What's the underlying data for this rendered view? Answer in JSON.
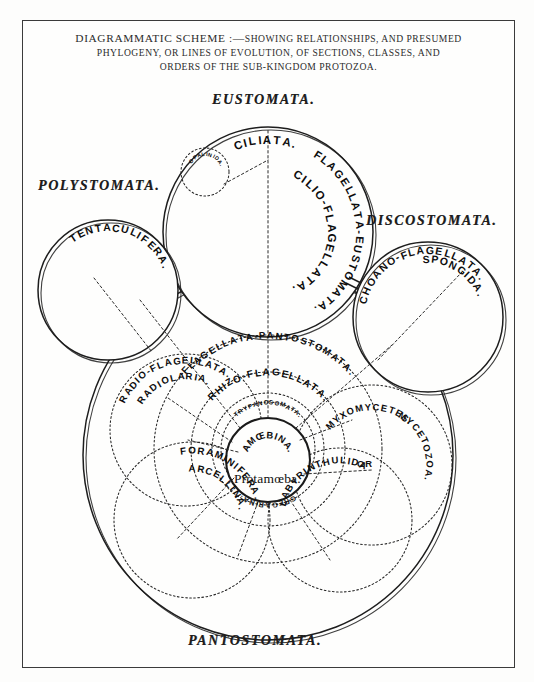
{
  "title": {
    "line1_lead": "DIAGRAMMATIC SCHEME :—",
    "line1_rest": "SHOWING RELATIONSHIPS, AND PRESUMED",
    "line2": "PHYLOGENY, OR LINES OF EVOLUTION, OF SECTIONS, CLASSES, AND",
    "line3": "ORDERS OF THE SUB-KINGDOM PROTOZOA."
  },
  "sections": {
    "eustomata": "EUSTOMATA.",
    "polystomata": "POLYSTOMATA.",
    "discostomata": "DISCOSTOMATA.",
    "pantostomata": "PANTOSTOMATA."
  },
  "groups": {
    "ciliata": "CILIATA.",
    "opalinida": "OPALINIDA.",
    "cilio_flagellata": "CILIO-FLAGELLATA.",
    "flagellata_eustomata": "FLAGELLATA-EUSTOMATA.",
    "tentaculifera": "TENTACULIFERA.",
    "spongida": "SPONGIDA.",
    "choano_flagellata": "CHOANO-FLAGELLATA.",
    "flagellata_pantostomata": "FLAGELLATA-PANTOSTOMATA.",
    "rhizo_flagellata": "RHIZO-FLAGELLATA.",
    "trypanosomata": "TRYPANOSOMATA.",
    "radiolaria": "RADIOLARIA.",
    "radio_flagellata": "RADIO-FLAGELLATA.",
    "myxomycetes": "MYXOMYCETES.",
    "or": "OR",
    "mycetozoa": "MYCETOZOA.",
    "amoebina": "AMŒBINA.",
    "protamoeba": "Protamœba.",
    "gregarina": "GREGARINA.",
    "arcellina": "ARCELLINA.",
    "foraminifera": "FORAMINIFERA.",
    "labyrinthulida": "LABYRINTHULIDA"
  },
  "colors": {
    "ink": "#1d1d1d",
    "paper": "#fdfdfc",
    "rule": "#3b3b3b"
  },
  "arcs": {
    "ciliata": {
      "cx": 268,
      "cy": 232,
      "r": 92,
      "start": -118,
      "sweep": 52,
      "size": 11.5,
      "text": "CILIATA."
    },
    "cilio_flagellata": {
      "cx": 268,
      "cy": 232,
      "r": 64,
      "start": -56,
      "sweep": 112,
      "size": 11.5,
      "text": "CILIO-FLAGELLATA."
    },
    "flagellata_eustomata": {
      "cx": 268,
      "cy": 232,
      "r": 92,
      "start": -60,
      "sweep": 120,
      "size": 11,
      "text": "FLAGELLATA-EUSTOMATA."
    },
    "opalinida": {
      "cx": 205,
      "cy": 172,
      "r": 18,
      "start": -118,
      "sweep": 68,
      "size": 5.4,
      "text": "OPALINIDA."
    },
    "tentaculifera": {
      "cx": 108,
      "cy": 290,
      "r": 63,
      "start": -112,
      "sweep": 76,
      "size": 10.5,
      "text": "TENTACULIFERA."
    },
    "spongida": {
      "cx": 428,
      "cy": 317,
      "r": 58,
      "start": -82,
      "sweep": 46,
      "size": 10.5,
      "text": "SPONGIDA."
    },
    "choano_flagellata": {
      "cx": 428,
      "cy": 317,
      "r": 67,
      "start": -158,
      "sweep": 112,
      "size": 10.5,
      "text": "CHOANO-FLAGELLATA."
    },
    "flagellata_pantostomata": {
      "cx": 268,
      "cy": 449,
      "r": 114,
      "start": -125,
      "sweep": 70,
      "size": 9.6,
      "text": "FLAGELLATA-PANTOSTOMATA."
    },
    "rhizo_flagellata": {
      "cx": 268,
      "cy": 449,
      "r": 77,
      "start": -122,
      "sweep": 64,
      "size": 10,
      "text": "RHIZO-FLAGELLATA."
    },
    "trypanosomata": {
      "cx": 268,
      "cy": 449,
      "r": 47,
      "start": -116,
      "sweep": 52,
      "size": 6.2,
      "text": "TRYPANOSOMATA."
    },
    "amoebina": {
      "cx": 268,
      "cy": 460,
      "r": 25,
      "start": -122,
      "sweep": 64,
      "size": 9.4,
      "text": "AMŒBINA."
    },
    "gregarina": {
      "cx": 268,
      "cy": 449,
      "r": 56,
      "start": 58,
      "sweep": 64,
      "size": 7.2,
      "text": "GREGARINA."
    },
    "radiolaria": {
      "cx": 186,
      "cy": 430,
      "r": 54,
      "start": -136,
      "sweep": 58,
      "size": 9.6,
      "text": "RADIOLARIA."
    },
    "radio_flagellata": {
      "cx": 186,
      "cy": 430,
      "r": 70,
      "start": -140,
      "sweep": 72,
      "size": 9.6,
      "text": "RADIO-FLAGELLATA."
    },
    "myxomycetes": {
      "cx": 372,
      "cy": 465,
      "r": 58,
      "start": -118,
      "sweep": 48,
      "size": 9.4,
      "text": "MYXOMYCETES."
    },
    "mycetozoa": {
      "cx": 372,
      "cy": 465,
      "r": 58,
      "start": -48,
      "sweep": 50,
      "size": 9.4,
      "text": "MYCETOZOA."
    },
    "arcellina": {
      "cx": 192,
      "cy": 520,
      "r": 52,
      "start": -84,
      "sweep": 62,
      "size": 9.6,
      "text": "ARCELLINA."
    },
    "foraminifera": {
      "cx": 192,
      "cy": 520,
      "r": 70,
      "start": -96,
      "sweep": 74,
      "size": 9.8,
      "text": "FORAMINIFERA."
    },
    "labyrinthulida": {
      "cx": 340,
      "cy": 520,
      "r": 60,
      "start": -150,
      "sweep": 70,
      "size": 9.6,
      "text": "LABYRINTHULIDA"
    }
  }
}
